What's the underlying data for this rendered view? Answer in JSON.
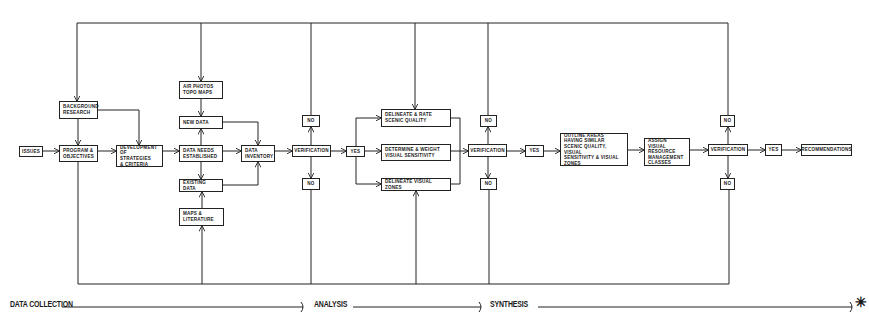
{
  "diagram": {
    "boxes": {
      "issues": "ISSUES",
      "program_objectives": "PROGRAM &\nOBJECTIVES",
      "background_research": "BACKGROUND\nRESEARCH",
      "development_strategies": "DEVELOPMENT\nOF STRATEGIES\n& CRITERIA",
      "air_photos": "AIR PHOTOS\nTOPO MAPS",
      "new_data": "NEW DATA",
      "data_needs": "DATA NEEDS\nESTABLISHED",
      "existing_data": "EXISTING DATA",
      "maps_literature": "MAPS &\nLITERATURE",
      "data_inventory": "DATA\nINVENTORY",
      "verification_1": "VERIFICATION",
      "no_1_top": "NO",
      "no_1_bottom": "NO",
      "yes_1": "YES",
      "delineate_rate": "DELINEATE & RATE\nSCENIC QUALITY",
      "determine_weight": "DETERMINE & WEIGHT\nVISUAL SENSITIVITY",
      "delineate_zones": "DELINEATE VISUAL ZONES",
      "verification_2": "VERIFICATION",
      "no_2_top": "NO",
      "no_2_bottom": "NO",
      "yes_2": "YES",
      "outline_areas": "OUTLINE AREAS\nHAVING SIMILAR\nSCENIC QUALITY, VISUAL\nSENSITIVITY & VISUAL\nZONES",
      "assign_classes": "ASSIGN VISUAL\nRESOURCE\nMANAGEMENT\nCLASSES",
      "verification_3": "VERIFICATION",
      "no_3_top": "NO",
      "no_3_bottom": "NO",
      "yes_3": "YES",
      "recommendations": "RECOMMENDATIONS"
    },
    "phases": {
      "data_collection": "DATA COLLECTION",
      "analysis": "ANALYSIS",
      "synthesis": "SYNTHESIS",
      "end_symbol": "✳"
    },
    "line_color": "#222222"
  }
}
